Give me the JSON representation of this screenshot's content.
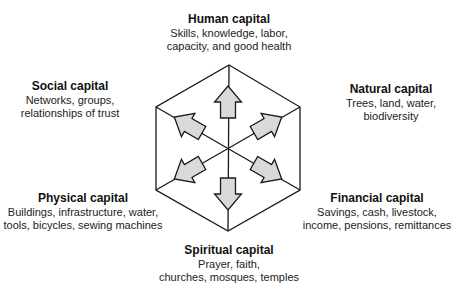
{
  "diagram": {
    "type": "hexagon-capitals",
    "center": {
      "x": 228,
      "y": 148
    },
    "stroke_color": "#1a1a1a",
    "arrow_fill": "#d9d9d9",
    "nodes": [
      {
        "id": "human",
        "title": "Human capital",
        "lines": [
          "Skills, knowledge, labor,",
          "capacity, and good health"
        ],
        "x": 229,
        "y": 12,
        "arrow_angle": -90
      },
      {
        "id": "natural",
        "title": "Natural capital",
        "lines": [
          "Trees, land, water,",
          "biodiversity"
        ],
        "x": 391,
        "y": 82,
        "arrow_angle": -30
      },
      {
        "id": "financial",
        "title": "Financial capital",
        "lines": [
          "Savings, cash, livestock,",
          "income, pensions, remittances"
        ],
        "x": 377,
        "y": 191,
        "arrow_angle": 30
      },
      {
        "id": "spiritual",
        "title": "Spiritual capital",
        "lines": [
          "Prayer, faith,",
          "churches, mosques, temples"
        ],
        "x": 229,
        "y": 243,
        "arrow_angle": 90
      },
      {
        "id": "physical",
        "title": "Physical capital",
        "lines": [
          "Buildings, infrastructure, water,",
          "tools, bicycles, sewing machines"
        ],
        "x": 83,
        "y": 191,
        "arrow_angle": 150
      },
      {
        "id": "social",
        "title": "Social capital",
        "lines": [
          "Networks, groups,",
          "relationships of trust"
        ],
        "x": 70,
        "y": 79,
        "arrow_angle": 210
      }
    ]
  }
}
